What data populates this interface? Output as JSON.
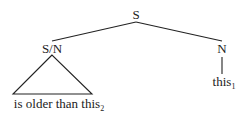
{
  "tree": {
    "root": {
      "label": "S"
    },
    "left": {
      "label": "S/N",
      "leaf_text": "is older than this",
      "leaf_sub": "2"
    },
    "right": {
      "label": "N",
      "leaf_text": "this",
      "leaf_sub": "1"
    }
  },
  "colors": {
    "line": "#222222",
    "background": "#ffffff"
  }
}
